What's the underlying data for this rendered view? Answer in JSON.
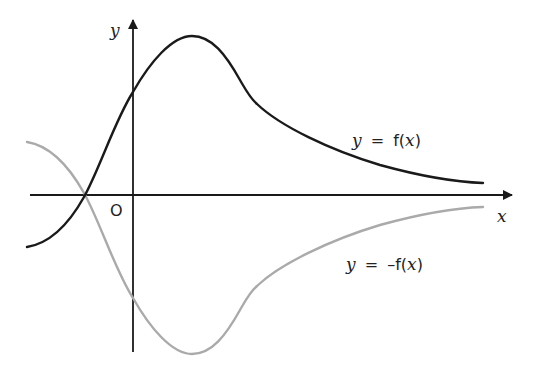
{
  "diagram": {
    "title": "",
    "axes": {
      "x_label": "x",
      "y_label": "y",
      "origin_label": "O"
    },
    "curves": [
      {
        "name": "f",
        "label_y": "y",
        "label_eq": "=",
        "label_fn": "f(",
        "label_var": "x",
        "label_close": ")",
        "color": "#1a1a1a",
        "path": "M27,247 C52,243 70,222 84,197 C100,168 115,120 133,92 C150,62 172,36 192,36 C212,36 226,55 240,80 C247,92 250,98 257,104 C280,126 330,150 380,165 C420,176 455,182 483,183"
      },
      {
        "name": "neg-f",
        "label_y": "y",
        "label_eq": "=",
        "label_fn": "–f(",
        "label_var": "x",
        "label_close": ")",
        "color": "#aaaaaa",
        "path": "M27,142 C52,146 70,168 84,193 C100,222 115,270 133,298 C150,328 172,354 192,354 C212,354 226,335 240,310 C247,298 250,292 257,286 C280,264 330,240 380,225 C420,214 455,208 483,207"
      }
    ],
    "colors": {
      "axis": "#1a1a1a",
      "f_curve": "#1a1a1a",
      "neg_f_curve": "#aaaaaa"
    }
  }
}
